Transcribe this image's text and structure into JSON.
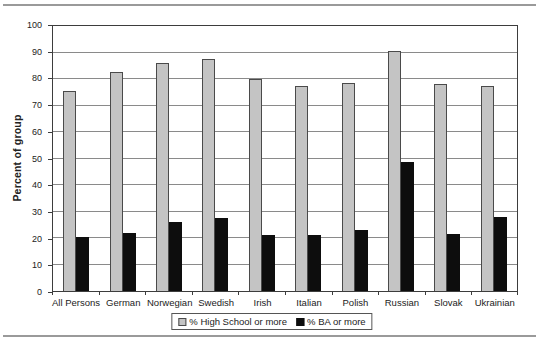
{
  "chart_data": {
    "type": "bar",
    "title": "",
    "ylabel": "Percent of group",
    "xlabel": "",
    "ylim": [
      0,
      100
    ],
    "yticks": [
      0,
      10,
      20,
      30,
      40,
      50,
      60,
      70,
      80,
      90,
      100
    ],
    "grid": true,
    "legend_position": "bottom-center",
    "categories": [
      "All Persons",
      "German",
      "Norwegian",
      "Swedish",
      "Irish",
      "Italian",
      "Polish",
      "Russian",
      "Slovak",
      "Ukrainian"
    ],
    "series": [
      {
        "name": "% High School or more",
        "color": "#c4c4c4",
        "values": [
          75.5,
          82.5,
          86,
          87.5,
          80,
          77.5,
          78.5,
          90.5,
          78,
          77.5
        ]
      },
      {
        "name": "% BA or more",
        "color": "#0d0d0d",
        "values": [
          20.5,
          22,
          26,
          27.5,
          21,
          21,
          23,
          48.5,
          21.5,
          28
        ]
      }
    ]
  },
  "colors": {
    "background": "#ffffff",
    "gridline": "#8a8a8a",
    "axis": "#3d3d3d",
    "bar_fill_hs": "#c4c4c4",
    "bar_fill_ba": "#0d0d0d",
    "page_rule": "#9a9a9a",
    "text": "#222222"
  }
}
